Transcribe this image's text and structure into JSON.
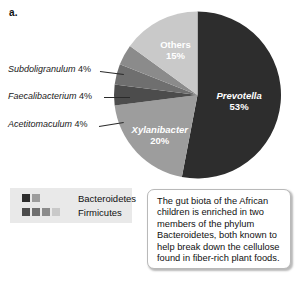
{
  "panel": {
    "letter": "a."
  },
  "chart_data": {
    "type": "pie",
    "title": "",
    "units": "percent",
    "start_angle_deg": 0,
    "direction": "clockwise",
    "categories": [
      "Prevotella",
      "Xylanibacter",
      "Acetitomaculum",
      "Faecalibacterium",
      "Subdoligranulum",
      "Others"
    ],
    "values": [
      53,
      20,
      4,
      4,
      4,
      15
    ],
    "labels_inside": [
      "Prevotella 53%",
      "Xylanibacter 20%",
      "Others 15%"
    ],
    "labels_outside": [
      "Acetitomaculum 4%",
      "Faecalibacterium 4%",
      "Subdoligranulum 4%"
    ],
    "colors": [
      "#2d2d2d",
      "#9d9d9d",
      "#4c4c4c",
      "#6f6f6f",
      "#8b8b8b",
      "#c9c9c9"
    ],
    "phylum_map": {
      "Bacteroidetes": [
        "Prevotella",
        "Xylanibacter"
      ],
      "Firmicutes": [
        "Acetitomaculum",
        "Faecalibacterium",
        "Subdoligranulum",
        "Others"
      ]
    },
    "legend_position": "bottom-left"
  },
  "slices": {
    "prevotella": {
      "name": "Prevotella",
      "pct": "53%",
      "value": 53,
      "color": "#2d2d2d"
    },
    "xylanibacter": {
      "name": "Xylanibacter",
      "pct": "20%",
      "value": 20,
      "color": "#9d9d9d"
    },
    "acetitomaculum": {
      "name": "Acetitomaculum",
      "pct": "4%",
      "value": 4,
      "color": "#4c4c4c"
    },
    "faecalibacterium": {
      "name": "Faecalibacterium",
      "pct": "4%",
      "value": 4,
      "color": "#6f6f6f"
    },
    "subdoligranulum": {
      "name": "Subdoligranulum",
      "pct": "4%",
      "value": 4,
      "color": "#8b8b8b"
    },
    "others": {
      "name": "Others",
      "pct": "15%",
      "value": 15,
      "color": "#c9c9c9"
    }
  },
  "callouts": [
    {
      "name": "Subdoligranulum",
      "pct": "4%"
    },
    {
      "name": "Faecalibacterium",
      "pct": "4%"
    },
    {
      "name": "Acetitomaculum",
      "pct": "4%"
    }
  ],
  "legend": {
    "rows": [
      {
        "label": "Bacteroidetes",
        "swatches": [
          "#2d2d2d",
          "#9d9d9d"
        ]
      },
      {
        "label": "Firmicutes",
        "swatches": [
          "#4c4c4c",
          "#6f6f6f",
          "#8b8b8b",
          "#c9c9c9"
        ]
      }
    ]
  },
  "caption": {
    "text": "The gut biota of the African children is enriched in two members of the phylum Bacteroidetes, both known to help break down the cellulose found in fiber-rich plant foods."
  }
}
